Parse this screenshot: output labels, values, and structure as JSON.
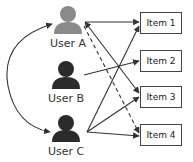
{
  "users": [
    {
      "id": "user-a",
      "label": "User A",
      "color": "#8a8a8a",
      "cx": 68,
      "cy": 18,
      "lx": 68,
      "ly": 38
    },
    {
      "id": "user-b",
      "label": "User B",
      "color": "#2b2b2b",
      "cx": 66,
      "cy": 74,
      "lx": 66,
      "ly": 93
    },
    {
      "id": "user-c",
      "label": "User C",
      "color": "#2b2b2b",
      "cx": 66,
      "cy": 128,
      "lx": 66,
      "ly": 146
    }
  ],
  "items": [
    {
      "id": "item-1",
      "label": "Item 1",
      "x": 140,
      "y": 12
    },
    {
      "id": "item-2",
      "label": "Item 2",
      "x": 140,
      "y": 50
    },
    {
      "id": "item-3",
      "label": "Item 3",
      "x": 140,
      "y": 86
    },
    {
      "id": "item-4",
      "label": "Item 4",
      "x": 140,
      "y": 124
    }
  ],
  "edges": [
    {
      "from": "User A",
      "to": "Item 1",
      "style": "solid"
    },
    {
      "from": "User A",
      "to": "Item 3",
      "style": "solid"
    },
    {
      "from": "User A",
      "to": "Item 4",
      "style": "dashed"
    },
    {
      "from": "User B",
      "to": "Item 2",
      "style": "solid"
    },
    {
      "from": "User C",
      "to": "Item 1",
      "style": "solid"
    },
    {
      "from": "User C",
      "to": "Item 3",
      "style": "solid"
    },
    {
      "from": "User C",
      "to": "Item 4",
      "style": "solid"
    },
    {
      "from": "User A",
      "to": "User C",
      "style": "curved-bidirectional"
    }
  ],
  "colors": {
    "line": "#333333",
    "box_border": "#444444"
  }
}
